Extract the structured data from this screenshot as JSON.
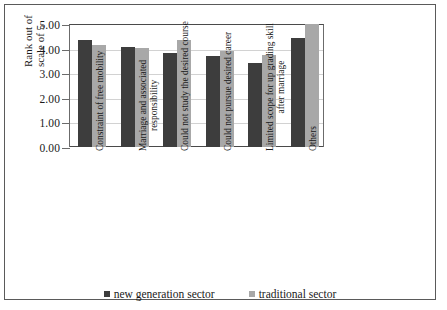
{
  "chart_data": {
    "type": "bar",
    "title": "",
    "xlabel": "",
    "ylabel_lines": [
      "Rank out of",
      "scale of 5"
    ],
    "ylabel": "Rank out of scale of 5",
    "ylim": [
      0,
      5
    ],
    "ytick_labels": [
      "0.00",
      "1.00",
      "2.00",
      "3.00",
      "4.00",
      "5.00"
    ],
    "ytick_values": [
      0,
      1,
      2,
      3,
      4,
      5
    ],
    "grid": true,
    "legend_position": "bottom",
    "categories": [
      "Constraint of free mobility",
      "Marriage and associated responsibility",
      "Could not study the desired course",
      "Could not pursue desired career",
      "Limited scope for up grading skill after marriage",
      "Others"
    ],
    "category_lines": [
      [
        "Constraint of free mobility"
      ],
      [
        "Marriage and associated",
        "responsibility"
      ],
      [
        "Could not study the desired course"
      ],
      [
        "Could not pursue desired career"
      ],
      [
        "Limited scope for up grading skill",
        "after marriage"
      ],
      [
        "Others"
      ]
    ],
    "series": [
      {
        "name": "new generation sector",
        "color": "#3d3d3d",
        "values": [
          4.35,
          4.07,
          3.82,
          3.72,
          3.42,
          4.45
        ]
      },
      {
        "name": "traditional sector",
        "color": "#a8a8a8",
        "values": [
          4.15,
          4.02,
          4.37,
          3.92,
          3.75,
          5.05
        ]
      }
    ]
  },
  "legend": {
    "items": [
      {
        "label": "new generation sector"
      },
      {
        "label": "traditional sector"
      }
    ]
  }
}
